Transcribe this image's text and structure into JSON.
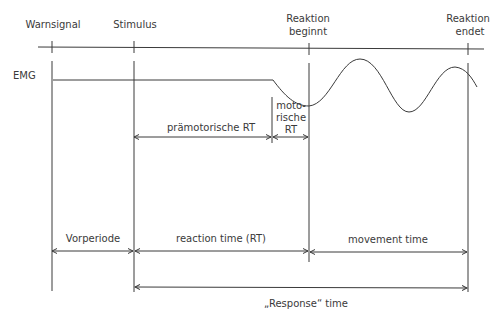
{
  "markers": {
    "warnsignal": "Warnsignal",
    "stimulus": "Stimulus",
    "reaktion_beginnt_1": "Reaktion",
    "reaktion_beginnt_2": "beginnt",
    "reaktion_endet_1": "Reaktion",
    "reaktion_endet_2": "endet"
  },
  "signal": {
    "emg": "EMG"
  },
  "intervals": {
    "praemotorische_rt": "prämotorische RT",
    "motorische_rt_1": "moto-",
    "motorische_rt_2": "rische",
    "motorische_rt_3": "RT",
    "vorperiode": "Vorperiode",
    "reaction_time": "reaction time (RT)",
    "movement_time": "movement time",
    "response_time": "„Response“ time"
  },
  "colors": {
    "line": "#3a3a3a",
    "background": "#ffffff"
  }
}
